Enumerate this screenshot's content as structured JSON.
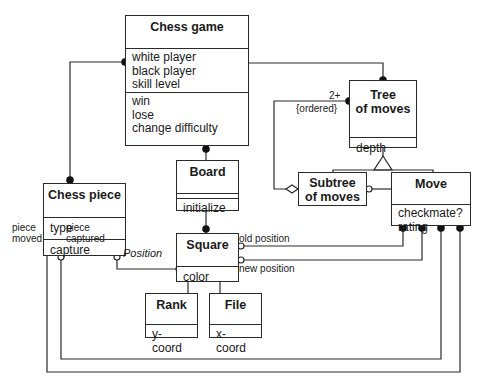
{
  "classes": {
    "chess_game": {
      "name": "Chess game",
      "attributes": [
        "white player",
        "black player",
        "skill level"
      ],
      "operations": [
        "win",
        "lose",
        "change difficulty"
      ]
    },
    "chess_piece": {
      "name": "Chess piece",
      "attributes": [
        "type"
      ],
      "operations": [
        "capture"
      ]
    },
    "board": {
      "name": "Board",
      "attributes": [],
      "operations": [
        "initialize"
      ]
    },
    "square": {
      "name": "Square",
      "attributes": [
        "color"
      ]
    },
    "rank": {
      "name": "Rank",
      "attributes": [
        "y-coord"
      ]
    },
    "file": {
      "name": "File",
      "attributes": [
        "x-coord"
      ]
    },
    "tree_of_moves": {
      "name_line1": "Tree",
      "name_line2": "of moves",
      "attributes": [
        "depth"
      ]
    },
    "subtree_of_moves": {
      "name_line1": "Subtree",
      "name_line2": "of moves"
    },
    "move": {
      "name": "Move",
      "attributes": [
        "checkmate?",
        "rating"
      ]
    }
  },
  "labels": {
    "multiplicity": "2+",
    "ordered": "{ordered}",
    "position": "Position",
    "old_position": "old position",
    "new_position": "new position",
    "piece_moved_1": "piece",
    "piece_moved_2": "moved",
    "piece_captured_1": "piece",
    "piece_captured_2": "captured"
  }
}
